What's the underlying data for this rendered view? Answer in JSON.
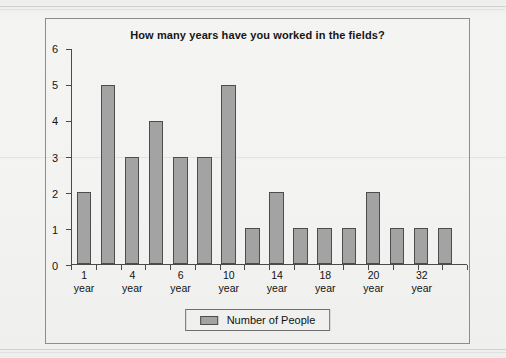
{
  "chart_data": {
    "type": "bar",
    "title": "How many years have you worked in the fields?",
    "xlabel": "",
    "ylabel": "",
    "ylim": [
      0,
      6
    ],
    "yticks": [
      0,
      1,
      2,
      3,
      4,
      5,
      6
    ],
    "grid": false,
    "legend_position": "bottom",
    "categories": [
      "1 year",
      "",
      "4 year",
      "",
      "6 year",
      "",
      "10 year",
      "",
      "14 year",
      "",
      "18 year",
      "",
      "20 year",
      "",
      "32 year",
      ""
    ],
    "tick_labels": [
      {
        "line1": "1",
        "line2": "year"
      },
      {
        "line1": "",
        "line2": ""
      },
      {
        "line1": "4",
        "line2": "year"
      },
      {
        "line1": "",
        "line2": ""
      },
      {
        "line1": "6",
        "line2": "year"
      },
      {
        "line1": "",
        "line2": ""
      },
      {
        "line1": "10",
        "line2": "year"
      },
      {
        "line1": "",
        "line2": ""
      },
      {
        "line1": "14",
        "line2": "year"
      },
      {
        "line1": "",
        "line2": ""
      },
      {
        "line1": "18",
        "line2": "year"
      },
      {
        "line1": "",
        "line2": ""
      },
      {
        "line1": "20",
        "line2": "year"
      },
      {
        "line1": "",
        "line2": ""
      },
      {
        "line1": "32",
        "line2": "year"
      },
      {
        "line1": "",
        "line2": ""
      }
    ],
    "series": [
      {
        "name": "Number of People",
        "color": "#a3a3a3",
        "values": [
          2,
          5,
          3,
          4,
          3,
          3,
          5,
          1,
          2,
          1,
          1,
          1,
          2,
          1,
          1,
          1
        ]
      }
    ]
  },
  "legend": {
    "label": "Number of People"
  },
  "colors": {
    "bar_fill": "#a3a3a3",
    "bar_border": "#4d4d4d",
    "axis": "#4a4a4a",
    "frame": "#8d8d8d",
    "page_background": "#f2f2f0"
  }
}
